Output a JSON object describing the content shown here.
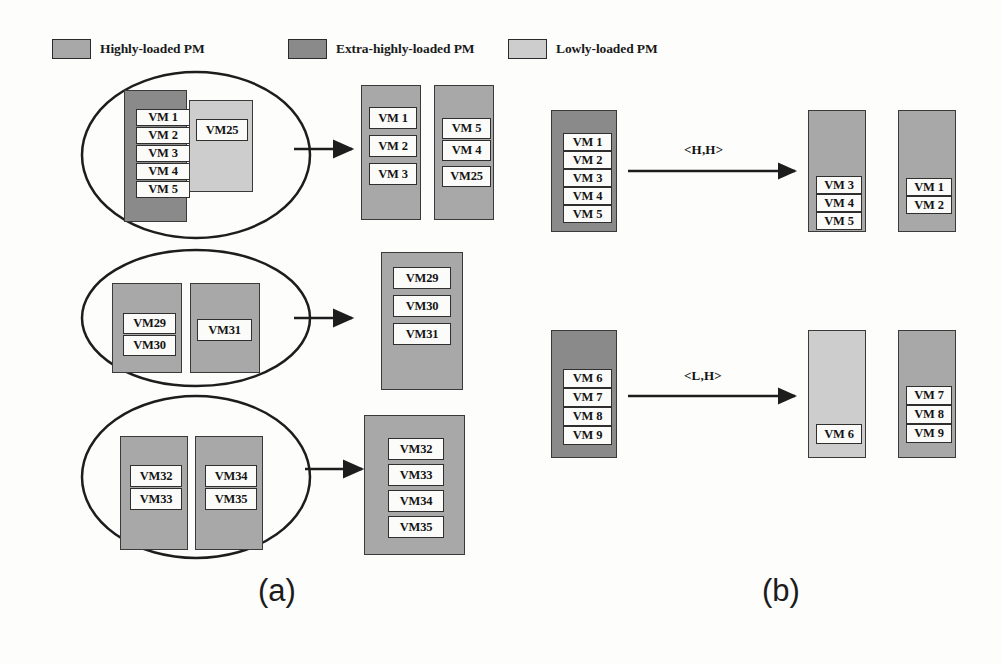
{
  "figure": {
    "background_color": "#fdfdfc"
  },
  "colors": {
    "highly_loaded": "#a8a8a8",
    "extra_highly_loaded": "#8a8a8a",
    "lowly_loaded": "#cdcdcd",
    "vm_fill": "#fbfbf9",
    "stroke": "#2f2f2f"
  },
  "legend": {
    "items": [
      {
        "label": "Highly-loaded PM",
        "color": "#a8a8a8",
        "swatch_name": "legend-swatch-highly-loaded"
      },
      {
        "label": "Extra-highly-loaded PM",
        "color": "#8a8a8a",
        "swatch_name": "legend-swatch-extra-highly-loaded"
      },
      {
        "label": "Lowly-loaded PM",
        "color": "#cdcdcd",
        "swatch_name": "legend-swatch-lowly-loaded"
      }
    ]
  },
  "panel_a": {
    "caption": "(a)",
    "groups": [
      {
        "name": "group-1",
        "source_pms": [
          {
            "type": "extra-highly-loaded",
            "vms": [
              "VM 1",
              "VM 2",
              "VM 3",
              "VM 4",
              "VM 5"
            ]
          },
          {
            "type": "lowly-loaded",
            "vms": [
              "VM25"
            ]
          }
        ],
        "result_pms": [
          {
            "type": "highly-loaded",
            "vms": [
              "VM 1",
              "VM 2",
              "VM 3"
            ]
          },
          {
            "type": "highly-loaded",
            "vms": [
              "VM 5",
              "VM 4",
              "VM25"
            ]
          }
        ]
      },
      {
        "name": "group-2",
        "source_pms": [
          {
            "type": "highly-loaded",
            "vms": [
              "VM29",
              "VM30"
            ]
          },
          {
            "type": "highly-loaded",
            "vms": [
              "VM31"
            ]
          }
        ],
        "result_pms": [
          {
            "type": "highly-loaded",
            "vms": [
              "VM29",
              "VM30",
              "VM31"
            ]
          }
        ]
      },
      {
        "name": "group-3",
        "source_pms": [
          {
            "type": "highly-loaded",
            "vms": [
              "VM32",
              "VM33"
            ]
          },
          {
            "type": "highly-loaded",
            "vms": [
              "VM34",
              "VM35"
            ]
          }
        ],
        "result_pms": [
          {
            "type": "highly-loaded",
            "vms": [
              "VM32",
              "VM33",
              "VM34",
              "VM35"
            ]
          }
        ]
      }
    ]
  },
  "panel_b": {
    "caption": "(b)",
    "rows": [
      {
        "name": "row-hh",
        "transition_label": "<H,H>",
        "source_pm": {
          "type": "extra-highly-loaded",
          "vms": [
            "VM 1",
            "VM 2",
            "VM 3",
            "VM 4",
            "VM 5"
          ]
        },
        "result_pms": [
          {
            "type": "highly-loaded",
            "vms": [
              "VM 3",
              "VM 4",
              "VM 5"
            ]
          },
          {
            "type": "highly-loaded",
            "vms": [
              "VM 1",
              "VM 2"
            ]
          }
        ]
      },
      {
        "name": "row-lh",
        "transition_label": "<L,H>",
        "source_pm": {
          "type": "extra-highly-loaded",
          "vms": [
            "VM 6",
            "VM 7",
            "VM 8",
            "VM 9"
          ]
        },
        "result_pms": [
          {
            "type": "lowly-loaded",
            "vms": [
              "VM 6"
            ]
          },
          {
            "type": "highly-loaded",
            "vms": [
              "VM 7",
              "VM 8",
              "VM 9"
            ]
          }
        ]
      }
    ]
  },
  "labels": {
    "a1_vm1": "VM 1",
    "a1_vm2": "VM 2",
    "a1_vm3": "VM 3",
    "a1_vm4": "VM 4",
    "a1_vm5": "VM 5",
    "a1_vm25": "VM25",
    "a1r_vm1": "VM 1",
    "a1r_vm2": "VM 2",
    "a1r_vm3": "VM 3",
    "a1r_vm5": "VM 5",
    "a1r_vm4": "VM 4",
    "a1r_vm25": "VM25",
    "a2_vm29": "VM29",
    "a2_vm30": "VM30",
    "a2_vm31": "VM31",
    "a2r_vm29": "VM29",
    "a2r_vm30": "VM30",
    "a2r_vm31": "VM31",
    "a3_vm32": "VM32",
    "a3_vm33": "VM33",
    "a3_vm34": "VM34",
    "a3_vm35": "VM35",
    "a3r_vm32": "VM32",
    "a3r_vm33": "VM33",
    "a3r_vm34": "VM34",
    "a3r_vm35": "VM35",
    "b1_vm1": "VM 1",
    "b1_vm2": "VM 2",
    "b1_vm3": "VM 3",
    "b1_vm4": "VM 4",
    "b1_vm5": "VM 5",
    "b1r_vm3": "VM 3",
    "b1r_vm4": "VM 4",
    "b1r_vm5": "VM 5",
    "b1r2_vm1": "VM 1",
    "b1r2_vm2": "VM 2",
    "b1_trans": "<H,H>",
    "b2_vm6": "VM 6",
    "b2_vm7": "VM 7",
    "b2_vm8": "VM 8",
    "b2_vm9": "VM 9",
    "b2r_vm6": "VM 6",
    "b2r2_vm7": "VM 7",
    "b2r2_vm8": "VM 8",
    "b2r2_vm9": "VM 9",
    "b2_trans": "<L,H>",
    "caption_a": "(a)",
    "caption_b": "(b)"
  }
}
